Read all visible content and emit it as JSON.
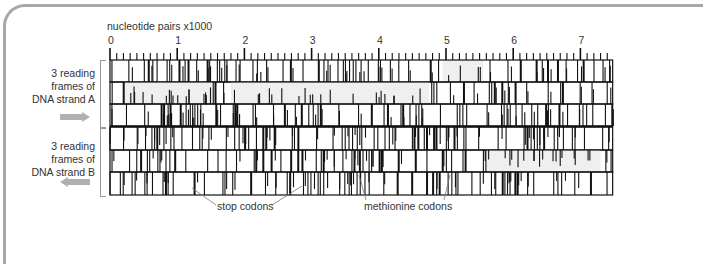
{
  "figure": {
    "axis_title": "nucleotide pairs x1000",
    "tick_labels": [
      "0",
      "1",
      "2",
      "3",
      "4",
      "5",
      "6",
      "7"
    ],
    "strand_a_label": [
      "3 reading",
      "frames of",
      "DNA strand A"
    ],
    "strand_b_label": [
      "3 reading",
      "frames of",
      "DNA strand B"
    ],
    "strand_a_direction": "right",
    "strand_b_direction": "left",
    "callouts": {
      "stop": "stop codons",
      "methionine": "methionine codons"
    },
    "colors": {
      "ink": "#111111",
      "orf_fill": "#efefef",
      "arrow": "#b0b0b0",
      "border": "#a8a8a8"
    },
    "length_kb": 7.48,
    "rows": [
      {
        "name": "strand-A-frame-1",
        "orfs": [
          [
            4.95,
            5.55
          ]
        ]
      },
      {
        "name": "strand-A-frame-2",
        "orfs": [
          [
            0.22,
            1.55
          ],
          [
            1.8,
            4.75
          ]
        ]
      },
      {
        "name": "strand-A-frame-3",
        "orfs": []
      },
      {
        "name": "strand-B-frame-1",
        "orfs": []
      },
      {
        "name": "strand-B-frame-2",
        "orfs": [
          [
            5.6,
            7.3
          ]
        ]
      },
      {
        "name": "strand-B-frame-3",
        "orfs": []
      }
    ]
  }
}
